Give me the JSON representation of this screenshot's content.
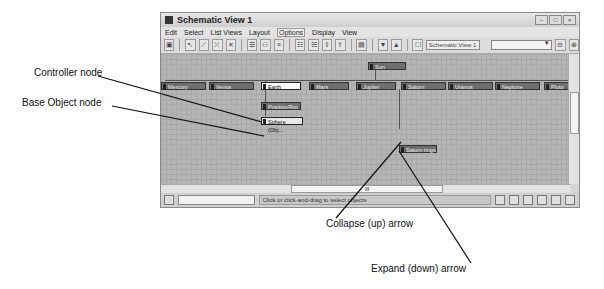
{
  "window": {
    "title": "Schematic View 1",
    "controls": [
      "–",
      "□",
      "×"
    ]
  },
  "menu": {
    "items": [
      "Edit",
      "Select",
      "List Views",
      "Layout",
      "Options",
      "Display",
      "View"
    ],
    "active": "Options"
  },
  "toolbar": {
    "view_name_field": "Schematic View 1",
    "dropdown_value": ""
  },
  "nodes": {
    "sun": "Sun",
    "planets": [
      "Mercury",
      "Venus",
      "Earth",
      "Mars",
      "Jupiter",
      "Saturn",
      "Uranus",
      "Neptune",
      "Pluto"
    ],
    "controller": "Position/Rot",
    "base_object": "Sphere (Obj...",
    "saturn_child": "Saturn rings"
  },
  "statusbar": {
    "prompt": "Click or click-and-drag to select objects",
    "scroll_label": "III"
  },
  "callouts": {
    "controller": "Controller node",
    "base_object": "Base Object node",
    "collapse": "Collapse (up) arrow",
    "expand": "Expand (down) arrow"
  }
}
